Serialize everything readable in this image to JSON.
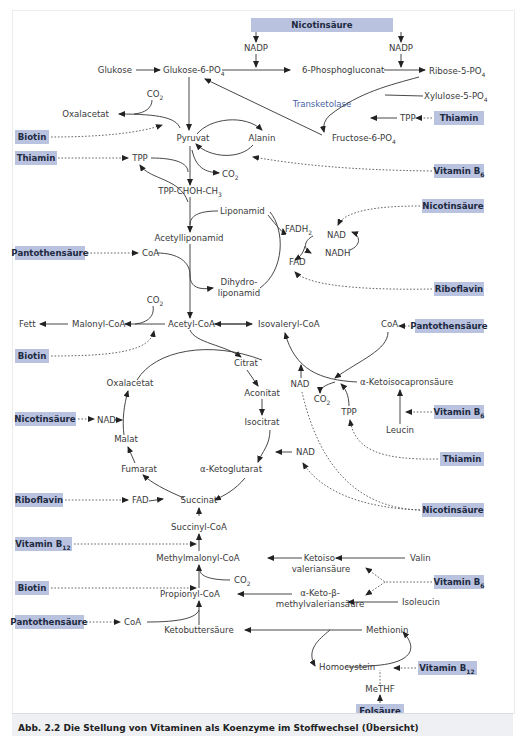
{
  "caption": "Abb. 2.2 Die Stellung von Vitaminen als Koenzyme im Stoffwechsel (Übersicht)",
  "vitamins": {
    "nicotinsaeure_top": "Nicotinsäure",
    "thiamin_ppp": "Thiamin",
    "biotin_1": "Biotin",
    "thiamin_1": "Thiamin",
    "vitb6_1": "Vitamin B6",
    "nicotinsaeure_2": "Nicotinsäure",
    "pantothen_1": "Pantothensäure",
    "riboflavin_1": "Riboflavin",
    "pantothen_2": "Pantothensäure",
    "biotin_2": "Biotin",
    "nicotinsaeure_3": "Nicotinsäure",
    "vitb6_2": "Vitamin B6",
    "thiamin_2": "Thiamin",
    "riboflavin_2": "Riboflavin",
    "nicotinsaeure_4": "Nicotinsäure",
    "vitb12_1": "Vitamin B12",
    "biotin_3": "Biotin",
    "vitb6_3": "Vitamin B6",
    "pantothen_3": "Pantothensäure",
    "vitb12_2": "Vitamin B12",
    "folsaeure": "Folsäure"
  },
  "metabolites": {
    "nadp_1": "NADP",
    "nadp_2": "NADP",
    "glukose": "Glukose",
    "glukose6p": "Glukose-6-PO4",
    "phosphogluconat": "6-Phosphogluconat",
    "ribose5p": "Ribose-5-PO4",
    "xylulose5p": "Xylulose-5-PO4",
    "transketolase": "Transketolase",
    "tpp_ppp": "TPP",
    "fructose6p": "Fructose-6-PO4",
    "co2_1": "CO2",
    "oxalacetat_1": "Oxalacetat",
    "pyruvat": "Pyruvat",
    "alanin": "Alanin",
    "tpp_1": "TPP",
    "co2_2": "CO2",
    "tpp_choh": "TPP-CHOH-CH3",
    "liponamid": "Liponamid",
    "fadh2": "FADH2",
    "nad_1": "NAD",
    "nadh": "NADH",
    "fad_1": "FAD",
    "acetylliponamid": "Acetylliponamid",
    "coa_1": "CoA",
    "dihydro": "Dihydro-",
    "liponamid2": "liponamid",
    "co2_3": "CO2",
    "fett": "Fett",
    "malonylcoa": "Malonyl-CoA",
    "acetylcoa": "Acetyl-CoA",
    "isovalerylcoa": "Isovaleryl-CoA",
    "coa_2": "CoA",
    "citrat": "Citrat",
    "oxalacetat_2": "Oxalacetat",
    "aconitat": "Aconitat",
    "nad_2": "NAD",
    "ketoisocapron": "α-Ketoisocapronsäure",
    "co2_4": "CO2",
    "tpp_2": "TPP",
    "nad_3": "NAD",
    "malat": "Malat",
    "isocitrat": "Isocitrat",
    "leucin": "Leucin",
    "nad_4": "NAD",
    "fumarat": "Fumarat",
    "ketoglutarat": "α-Ketoglutarat",
    "fad_2": "FAD",
    "succinat": "Succinat",
    "succinylcoa": "Succinyl-CoA",
    "methylmalonylcoa": "Methylmalonyl-CoA",
    "ketoiso": "Ketoiso-",
    "valeriansaeure": "valeriansäure",
    "valin": "Valin",
    "co2_5": "CO2",
    "propionylcoa": "Propionyl-CoA",
    "ketobeta": "α-Keto-β-",
    "methylvalerian": "methylvaleriansäure",
    "isoleucin": "Isoleucin",
    "coa_3": "CoA",
    "ketobutter": "Ketobuttersäure",
    "methionin": "Methionin",
    "homocystein": "Homocystein",
    "methf": "MeTHF"
  }
}
